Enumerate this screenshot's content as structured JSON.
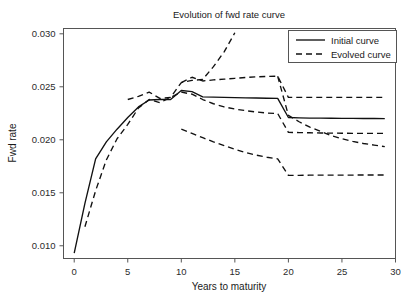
{
  "chart_data": {
    "type": "line",
    "title": "Evolution of fwd rate curve",
    "xlabel": "Years to maturity",
    "ylabel": "Fwd rate",
    "xlim": [
      -1,
      30
    ],
    "ylim": [
      0.0088,
      0.0305
    ],
    "xticks": [
      0,
      5,
      10,
      15,
      20,
      25,
      30
    ],
    "xtick_labels": [
      "0",
      "5",
      "10",
      "15",
      "20",
      "25",
      "30"
    ],
    "yticks": [
      0.01,
      0.015,
      0.02,
      0.025,
      0.03
    ],
    "ytick_labels": [
      "0.010",
      "0.015",
      "0.020",
      "0.025",
      "0.030"
    ],
    "grid": false,
    "legend_position": "top-right",
    "legend": [
      {
        "label": "Initial curve",
        "style": "solid"
      },
      {
        "label": "Evolved curve",
        "style": "dashed"
      }
    ],
    "series": [
      {
        "name": "Initial curve",
        "style": "solid",
        "x": [
          0,
          1,
          2,
          3,
          4,
          5,
          6,
          7,
          8,
          9,
          10,
          11,
          12,
          13,
          14,
          15,
          16,
          17,
          18,
          19,
          20,
          21,
          22,
          23,
          24,
          25,
          26,
          27,
          28,
          29
        ],
        "y": [
          0.0093,
          0.014,
          0.0182,
          0.0198,
          0.021,
          0.0221,
          0.0231,
          0.02375,
          0.0238,
          0.0238,
          0.02465,
          0.02455,
          0.02405,
          0.02402,
          0.024,
          0.02398,
          0.02396,
          0.02394,
          0.02392,
          0.0239,
          0.0221,
          0.02207,
          0.02205,
          0.02204,
          0.02203,
          0.02202,
          0.02202,
          0.02201,
          0.02201,
          0.022
        ]
      },
      {
        "name": "Evolved curve A (upper, exits top)",
        "style": "dashed",
        "x": [
          5,
          6,
          7,
          8,
          9,
          10,
          11,
          12,
          13,
          14,
          15
        ],
        "y": [
          0.0238,
          0.0241,
          0.0245,
          0.0239,
          0.024,
          0.0254,
          0.0256,
          0.0257,
          0.0269,
          0.0283,
          0.0301
        ]
      },
      {
        "name": "Evolved curve B (upper plateau)",
        "style": "dashed",
        "x": [
          10,
          11,
          12,
          13,
          14,
          15,
          16,
          17,
          18,
          19,
          20,
          21,
          22,
          23,
          24,
          25,
          26,
          27,
          28,
          29
        ],
        "y": [
          0.0254,
          0.0259,
          0.02555,
          0.02565,
          0.02572,
          0.0258,
          0.02588,
          0.02594,
          0.02598,
          0.026,
          0.024,
          0.024,
          0.024,
          0.024,
          0.024,
          0.024,
          0.024,
          0.024,
          0.024,
          0.024
        ]
      },
      {
        "name": "Evolved curve C (lower rising then decaying)",
        "style": "dashed",
        "x": [
          1,
          2,
          3,
          4,
          5,
          6,
          7,
          8,
          9,
          10,
          11,
          12,
          13,
          14,
          15,
          16,
          17,
          18,
          19,
          20,
          21,
          22,
          23,
          24,
          25,
          26,
          27,
          28,
          29
        ],
        "y": [
          0.0118,
          0.0152,
          0.0181,
          0.0201,
          0.02145,
          0.023,
          0.0238,
          0.0235,
          0.024,
          0.0245,
          0.0243,
          0.0238,
          0.0234,
          0.0231,
          0.0229,
          0.02275,
          0.02262,
          0.02252,
          0.02248,
          0.0207,
          0.02068,
          0.02066,
          0.02064,
          0.02063,
          0.02062,
          0.02061,
          0.02061,
          0.0206,
          0.0206
        ]
      },
      {
        "name": "Evolved curve D (crossing tail)",
        "style": "dashed",
        "x": [
          19,
          20,
          21,
          22,
          23,
          24,
          25,
          26,
          27,
          28,
          29
        ],
        "y": [
          0.026,
          0.0223,
          0.0217,
          0.0212,
          0.0208,
          0.0204,
          0.0201,
          0.01985,
          0.01965,
          0.0195,
          0.01935
        ]
      },
      {
        "name": "Evolved curve E (bottom)",
        "style": "dashed",
        "x": [
          10,
          11,
          12,
          13,
          14,
          15,
          16,
          17,
          18,
          19,
          20,
          21,
          22,
          23,
          24,
          25,
          26,
          27,
          28,
          29
        ],
        "y": [
          0.021,
          0.0206,
          0.0202,
          0.0198,
          0.01945,
          0.0191,
          0.0188,
          0.01855,
          0.01835,
          0.0182,
          0.01665,
          0.01665,
          0.01666,
          0.01666,
          0.01667,
          0.01667,
          0.01667,
          0.01668,
          0.01668,
          0.01668
        ]
      }
    ]
  }
}
